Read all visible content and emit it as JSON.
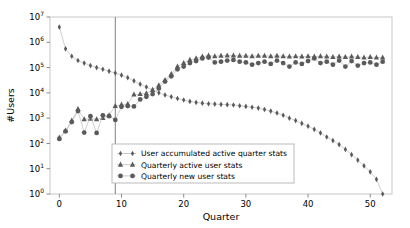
{
  "chart_data": {
    "type": "scatter",
    "title": "",
    "xlabel": "Quarter",
    "ylabel": "#Users",
    "xlim": [
      -1.5,
      53.5
    ],
    "ylim": [
      1,
      10000000
    ],
    "yscale": "log",
    "grid": false,
    "legend_position": "lower center",
    "xticks": [
      0,
      10,
      20,
      30,
      40,
      50
    ],
    "xticklabels": [
      "0",
      "10",
      "20",
      "30",
      "40",
      "50"
    ],
    "yticks": [
      1,
      10,
      100,
      1000,
      10000,
      100000,
      1000000,
      10000000
    ],
    "yticklabels": [
      "10^0",
      "10^1",
      "10^2",
      "10^3",
      "10^4",
      "10^5",
      "10^6",
      "10^7"
    ],
    "yticklabel_bases": [
      "10",
      "10",
      "10",
      "10",
      "10",
      "10",
      "10",
      "10"
    ],
    "yticklabel_exponents": [
      "0",
      "1",
      "2",
      "3",
      "4",
      "5",
      "6",
      "7"
    ],
    "annotations": [
      {
        "type": "vline",
        "x": 9,
        "color": "#808080",
        "label": ""
      }
    ],
    "marker_color": "#5a5a5a",
    "line_color": "#b0b0b0",
    "x": [
      0,
      1,
      2,
      3,
      4,
      5,
      6,
      7,
      8,
      9,
      10,
      11,
      12,
      13,
      14,
      15,
      16,
      17,
      18,
      19,
      20,
      21,
      22,
      23,
      24,
      25,
      26,
      27,
      28,
      29,
      30,
      31,
      32,
      33,
      34,
      35,
      36,
      37,
      38,
      39,
      40,
      41,
      42,
      43,
      44,
      45,
      46,
      47,
      48,
      49,
      50,
      51,
      52
    ],
    "series": [
      {
        "name": "User accumulated active quarter stats",
        "marker": "thin_diamond",
        "values": [
          4000000,
          550000,
          280000,
          190000,
          150000,
          120000,
          100000,
          86000,
          72000,
          61000,
          50000,
          40000,
          30000,
          22000,
          17000,
          13000,
          10000,
          8200,
          7000,
          6000,
          5200,
          4600,
          4200,
          3900,
          3700,
          3600,
          3500,
          3400,
          3300,
          3100,
          2900,
          2700,
          2500,
          2200,
          1900,
          1600,
          1300,
          1000,
          800,
          620,
          480,
          360,
          260,
          180,
          130,
          90,
          58,
          36,
          22,
          13,
          7.5,
          3.8,
          1.0
        ]
      },
      {
        "name": "Quarterly active user stats",
        "marker": "triangle_up",
        "values": [
          170,
          320,
          800,
          2300,
          900,
          950,
          900,
          1000,
          1300,
          3000,
          3400,
          3600,
          8500,
          9000,
          9500,
          13000,
          20000,
          32000,
          55000,
          110000,
          150000,
          200000,
          230000,
          270000,
          300000,
          280000,
          290000,
          300000,
          300000,
          290000,
          290000,
          280000,
          290000,
          290000,
          280000,
          290000,
          280000,
          270000,
          280000,
          270000,
          280000,
          270000,
          280000,
          270000,
          260000,
          270000,
          260000,
          270000,
          260000,
          250000,
          260000,
          250000,
          250000
        ]
      },
      {
        "name": "Quarterly new user stats",
        "marker": "circle",
        "values": [
          150,
          300,
          700,
          1900,
          270,
          1200,
          260,
          1300,
          1200,
          850,
          2800,
          3000,
          2900,
          5500,
          7000,
          9000,
          15000,
          28000,
          45000,
          85000,
          110000,
          150000,
          180000,
          230000,
          250000,
          160000,
          170000,
          190000,
          200000,
          170000,
          160000,
          130000,
          150000,
          170000,
          140000,
          190000,
          150000,
          110000,
          160000,
          140000,
          180000,
          230000,
          150000,
          170000,
          130000,
          190000,
          110000,
          180000,
          120000,
          150000,
          160000,
          130000,
          170000
        ]
      }
    ],
    "legend_entries": [
      {
        "label": "User accumulated active quarter stats",
        "marker": "thin_diamond"
      },
      {
        "label": "Quarterly active user stats",
        "marker": "triangle_up"
      },
      {
        "label": "Quarterly new user stats",
        "marker": "circle"
      }
    ]
  }
}
